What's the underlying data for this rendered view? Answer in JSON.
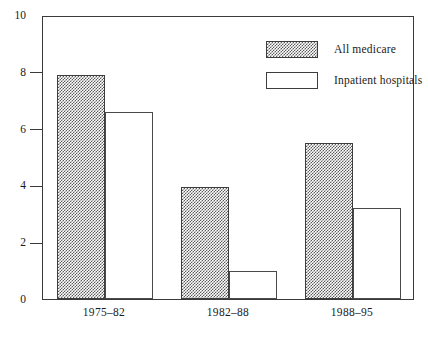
{
  "chart_data": {
    "type": "bar",
    "title": "",
    "subtitle": "",
    "xlabel": "",
    "ylabel": "",
    "categories": [
      "1975–82",
      "1982–88",
      "1988–95"
    ],
    "series": [
      {
        "name": "All medicare",
        "values": [
          7.9,
          3.95,
          5.5
        ],
        "fill": "checkerboard-gray",
        "color": "#5c5c5c"
      },
      {
        "name": "Inpatient hospitals",
        "values": [
          6.6,
          1.0,
          3.2
        ],
        "fill": "white",
        "color": "#ffffff"
      }
    ],
    "ylim": [
      0,
      10
    ],
    "yticks": [
      0,
      2,
      4,
      6,
      8,
      10
    ],
    "ytick_labels": [
      "0",
      "2",
      "4",
      "6",
      "8",
      "10"
    ],
    "grid": false,
    "legend_position": "top-right-inside",
    "frame": true,
    "axis_color": "#3a3a3a"
  },
  "legend": {
    "items": [
      {
        "label": "All medicare",
        "style": "shaded"
      },
      {
        "label": "Inpatient hospitals",
        "style": "open"
      }
    ]
  }
}
